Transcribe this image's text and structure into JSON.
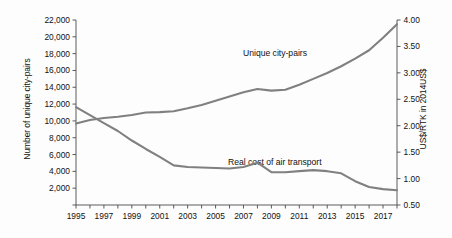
{
  "chart_data": {
    "type": "line",
    "title": "",
    "xlabel": "",
    "x": [
      1995,
      1996,
      1997,
      1998,
      1999,
      2000,
      2001,
      2002,
      2003,
      2004,
      2005,
      2006,
      2007,
      2008,
      2009,
      2010,
      2011,
      2012,
      2013,
      2014,
      2015,
      2016,
      2017,
      2018
    ],
    "xtick_labels": [
      "1995",
      "1997",
      "1999",
      "2001",
      "2003",
      "2005",
      "2007",
      "2009",
      "2011",
      "2013",
      "2015",
      "2017"
    ],
    "xlim": [
      1995,
      2018
    ],
    "grid": false,
    "legend_position": "inline-annotations",
    "series": [
      {
        "name": "Unique city-pairs",
        "axis": "left",
        "units": "city-pairs",
        "color": "#808080",
        "values": [
          9700,
          10100,
          10350,
          10500,
          10700,
          11000,
          11050,
          11150,
          11500,
          11900,
          12400,
          12900,
          13400,
          13800,
          13600,
          13700,
          14300,
          15000,
          15700,
          16500,
          17400,
          18400,
          19900,
          21500
        ]
      },
      {
        "name": "Real cost of air transport",
        "axis": "right",
        "units": "US$/RTK in 2014US$",
        "color": "#808080",
        "values": [
          2.35,
          2.2,
          2.05,
          1.9,
          1.72,
          1.56,
          1.41,
          1.25,
          1.22,
          1.21,
          1.2,
          1.19,
          1.22,
          1.3,
          1.12,
          1.12,
          1.14,
          1.16,
          1.14,
          1.1,
          0.95,
          0.84,
          0.8,
          0.78
        ]
      }
    ],
    "left_axis": {
      "label": "Number of unique city-pairs",
      "ylim": [
        0,
        22000
      ],
      "ticks": [
        0,
        2000,
        4000,
        6000,
        8000,
        10000,
        12000,
        14000,
        16000,
        18000,
        20000,
        22000
      ],
      "tick_labels": [
        "",
        "2,000",
        "4,000",
        "6,000",
        "8,000",
        "10,000",
        "12,000",
        "14,000",
        "16,000",
        "18,000",
        "20,000",
        "22,000"
      ]
    },
    "right_axis": {
      "label": "US$/RTK in 2014US$",
      "ylim": [
        0.5,
        4.0
      ],
      "ticks": [
        0.5,
        1.0,
        1.5,
        2.0,
        2.5,
        3.0,
        3.5,
        4.0
      ],
      "tick_labels": [
        "0.50",
        "1.00",
        "1.50",
        "2.00",
        "2.50",
        "3.00",
        "3.50",
        "4.00"
      ]
    },
    "annotations": [
      {
        "text": "Unique city-pairs",
        "series": "Unique city-pairs"
      },
      {
        "text": "Real cost of air transport",
        "series": "Real cost of air transport"
      }
    ]
  }
}
